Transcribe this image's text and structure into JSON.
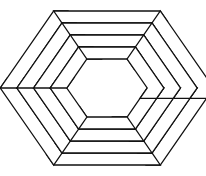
{
  "figure": {
    "center": [
      107,
      88
    ],
    "ring_half_heights": [
      77,
      65,
      53,
      41,
      29
    ],
    "hex_aspect": 1.2,
    "slat_count_per_ring": 6,
    "stroke_color": "#111111",
    "fill_color": "#ffffff",
    "background": "#ffffff"
  }
}
